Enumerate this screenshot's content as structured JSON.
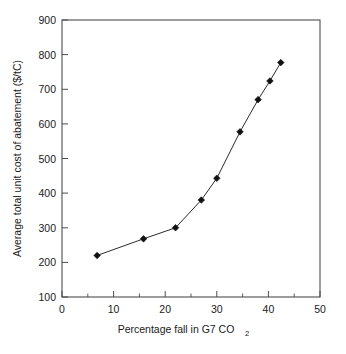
{
  "chart_data": {
    "type": "line",
    "title": "",
    "subtitle": "",
    "xlabel": "Percentage fall in G7 CO2",
    "xlabel_main": "Percentage fall in G7 CO",
    "xlabel_sub": "2",
    "ylabel": "Average total unit cost of abatement ($/tC)",
    "xlim": [
      0,
      50
    ],
    "ylim": [
      100,
      900
    ],
    "xticks": [
      0,
      10,
      20,
      30,
      40,
      50
    ],
    "xtick_labels": [
      "0",
      "10",
      "20",
      "30",
      "40",
      "50"
    ],
    "x_minor_ticks": [
      5,
      15,
      25,
      35,
      45
    ],
    "yticks": [
      100,
      200,
      300,
      400,
      500,
      600,
      700,
      800,
      900
    ],
    "ytick_labels": [
      "100",
      "200",
      "300",
      "400",
      "500",
      "600",
      "700",
      "800",
      "900"
    ],
    "grid": false,
    "legend": null,
    "legend_position": "none",
    "marker": "diamond",
    "line_color": "#2b2b2b",
    "marker_color": "#111111",
    "series": [
      {
        "name": "Average total unit cost of abatement",
        "x": [
          6.8,
          15.8,
          22.0,
          27.0,
          30.0,
          34.5,
          38.0,
          40.3,
          42.4
        ],
        "values": [
          220,
          268,
          300,
          380,
          443,
          577,
          670,
          724,
          777
        ]
      }
    ]
  },
  "axis": {
    "x_tick_labels": [
      "0",
      "10",
      "20",
      "30",
      "40",
      "50"
    ],
    "y_tick_labels": [
      "100",
      "200",
      "300",
      "400",
      "500",
      "600",
      "700",
      "800",
      "900"
    ],
    "x_title_main": "Percentage fall in G7 CO",
    "x_title_sub": "2",
    "y_title": "Average total unit cost of abatement ($/tC)"
  }
}
